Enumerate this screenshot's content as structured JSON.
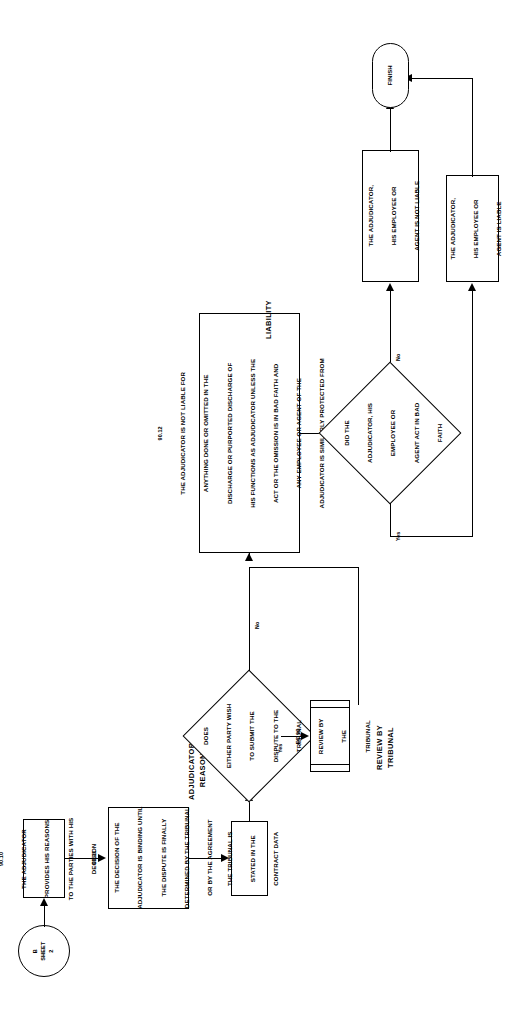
{
  "figure": {
    "orientation": "landscape-rotated-90ccw",
    "ink_color": "#000000",
    "paper_color": "#ffffff"
  },
  "sections": {
    "adjudicators_reasons": "ADJUDICATOR'S\nREASONS",
    "adjudicators_reasons_line1": "ADJUDICATOR'S",
    "adjudicators_reasons_line2": "REASONS",
    "liability": "LIABILITY",
    "review_by_tribunal_line1": "REVIEW BY",
    "review_by_tribunal_line2": "TRIBUNAL"
  },
  "nodes": {
    "off_page_connector": {
      "shape": "circle",
      "letter": "B",
      "sheet_word": "SHEET",
      "sheet_number": "2"
    },
    "step_90_10": {
      "shape": "process",
      "number": "90.10",
      "lines": [
        "THE ADJUDICATOR",
        "PROVIDES HIS REASONS",
        "TO THE PARTIES WITH HIS",
        "DECISION"
      ]
    },
    "step_90_11": {
      "shape": "process",
      "number": "90.11",
      "lines": [
        "THE DECISION OF THE",
        "ADJUDICATOR IS BINDING UNTIL",
        "THE DISPUTE IS FINALLY",
        "DETERMINED BY THE TRIBUNAL",
        "OR BY THE AGREEMENT"
      ]
    },
    "tribunal_stated": {
      "shape": "process",
      "lines": [
        "THE TRIBUNAL IS",
        "STATED IN THE",
        "CONTRACT DATA"
      ]
    },
    "decision_submit": {
      "shape": "decision",
      "lines": [
        "DOES",
        "EITHER PARTY WISH",
        "TO SUBMIT THE",
        "DISPUTE TO THE",
        "TRIBUNAL"
      ],
      "branch_yes": "Yes",
      "branch_no": "No"
    },
    "fc93_review": {
      "shape": "predefined-process",
      "number": "FC 93",
      "lines": [
        "REVIEW BY",
        "THE",
        "TRIBUNAL"
      ]
    },
    "step_90_12": {
      "shape": "process",
      "number": "90.12",
      "lines": [
        "THE ADJUDICATOR IS NOT LIABLE FOR",
        "ANYTHING DONE OR OMITTED IN THE",
        "DISCHARGE OR PURPORTED DISCHARGE OF",
        "HIS FUNCTIONS AS ADJUDICATOR UNLESS THE",
        "ACT OR THE OMISSION IS IN BAD FAITH AND",
        "ANY EMPLOYEE OR AGENT OF THE",
        "ADJUDICATOR IS SIMILARLY PROTECTED FROM",
        "LIABILITY"
      ]
    },
    "decision_bad_faith": {
      "shape": "decision",
      "lines": [
        "DID THE",
        "ADJUDICATOR, HIS",
        "EMPLOYEE OR",
        "AGENT ACT IN BAD",
        "FAITH"
      ],
      "branch_yes": "Yes",
      "branch_no": "No"
    },
    "not_liable": {
      "shape": "process",
      "lines": [
        "THE ADJUDICATOR,",
        "HIS EMPLOYEE OR",
        "AGENT IS NOT LIABLE"
      ]
    },
    "is_liable": {
      "shape": "process",
      "lines": [
        "THE ADJUDICATOR,",
        "HIS EMPLOYEE OR",
        "AGENT IS LIABLE"
      ]
    },
    "finish": {
      "shape": "terminator",
      "label": "FINISH"
    }
  }
}
